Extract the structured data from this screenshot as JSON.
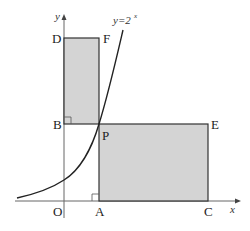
{
  "figure": {
    "curve_label": "y=2",
    "curve_exponent": "x",
    "axis_x_label": "x",
    "axis_y_label": "y",
    "points": {
      "D": "D",
      "F": "F",
      "B": "B",
      "P": "P",
      "E": "E",
      "O": "O",
      "A": "A",
      "C": "C"
    },
    "colors": {
      "fill": "#d4d4d4",
      "stroke": "#333333",
      "axis": "#555555",
      "curve": "#222222"
    }
  }
}
